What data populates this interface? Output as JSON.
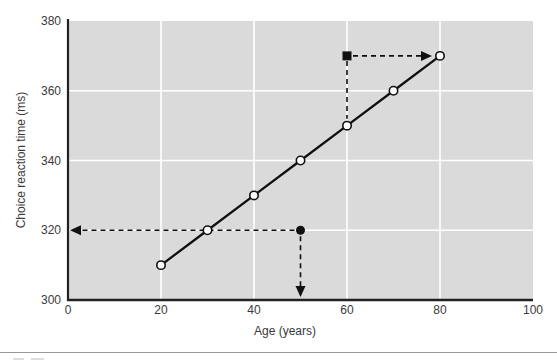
{
  "chart_data": {
    "type": "line",
    "title": "",
    "xlabel": "Age (years)",
    "ylabel": "Choice reaction time (ms)",
    "x": [
      20,
      30,
      40,
      50,
      60,
      70,
      80
    ],
    "y": [
      310,
      320,
      330,
      340,
      350,
      360,
      370
    ],
    "xlim": [
      0,
      100
    ],
    "ylim": [
      300,
      380
    ],
    "xticks": [
      0,
      20,
      40,
      60,
      80,
      100
    ],
    "yticks": [
      300,
      320,
      340,
      360,
      380
    ],
    "grid": true,
    "legend": false,
    "marker": "open-circle",
    "annotations": {
      "square_marker": {
        "x": 60,
        "y": 370
      },
      "dot_marker": {
        "x": 50,
        "y": 320
      },
      "dashed_arrows": [
        {
          "x1": 60,
          "y1": 370,
          "x2": 80,
          "y2": 370,
          "head": "right"
        },
        {
          "x1": 60,
          "y1": 370,
          "x2": 60,
          "y2": 350,
          "head": "none"
        },
        {
          "x1": 50,
          "y1": 320,
          "x2": 0,
          "y2": 320,
          "head": "left"
        },
        {
          "x1": 50,
          "y1": 320,
          "x2": 50,
          "y2": 300,
          "head": "down"
        }
      ]
    }
  },
  "colors": {
    "plot_bg": "#dadada",
    "grid": "#ffffff",
    "axis": "#222222",
    "line": "#101010",
    "marker_fill": "#ffffff",
    "text": "#3a3a3a",
    "divider": "#999999"
  }
}
